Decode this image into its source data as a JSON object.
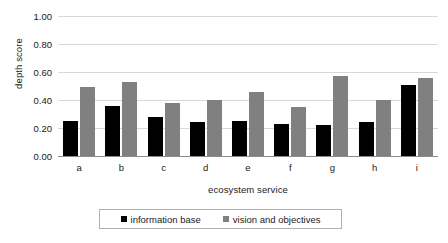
{
  "chart_data": {
    "type": "bar",
    "title": "",
    "xlabel": "ecosystem service",
    "ylabel": "depth score",
    "categories": [
      "a",
      "b",
      "c",
      "d",
      "e",
      "f",
      "g",
      "h",
      "i"
    ],
    "series": [
      {
        "name": "information base",
        "color": "#000000",
        "values": [
          0.25,
          0.36,
          0.28,
          0.24,
          0.25,
          0.23,
          0.22,
          0.24,
          0.51
        ]
      },
      {
        "name": "vision and objectives",
        "color": "#808080",
        "values": [
          0.49,
          0.53,
          0.38,
          0.4,
          0.46,
          0.35,
          0.57,
          0.4,
          0.56
        ]
      }
    ],
    "ylim": [
      0.0,
      1.0
    ],
    "yticks": [
      "0.00",
      "0.20",
      "0.40",
      "0.60",
      "0.80",
      "1.00"
    ],
    "ytick_values": [
      0.0,
      0.2,
      0.4,
      0.6,
      0.8,
      1.0
    ],
    "grid": true,
    "legend_position": "bottom"
  }
}
